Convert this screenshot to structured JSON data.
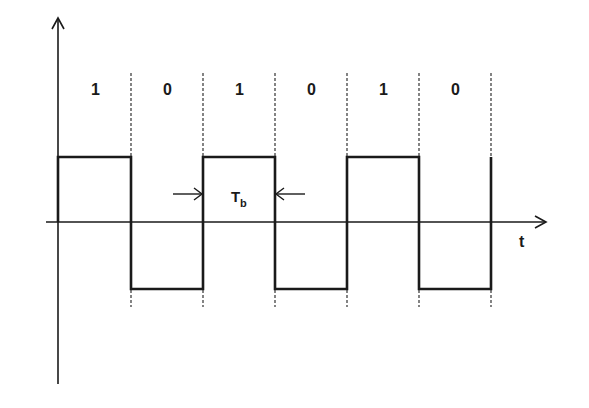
{
  "diagram": {
    "type": "polar-NRZ-square-wave",
    "bits": [
      "1",
      "0",
      "1",
      "0",
      "1",
      "0"
    ],
    "bit_period_label": "T",
    "bit_period_subscript": "b",
    "x_axis_label": "t",
    "colors": {
      "stroke": "#1a1a1a",
      "dashed": "#333333",
      "background": "#ffffff"
    },
    "geometry": {
      "y_axis_x": 58,
      "x_axis_y": 222,
      "high_y": 157,
      "low_y": 289,
      "boundaries_x": [
        58,
        131,
        203,
        275,
        347,
        419,
        491
      ]
    }
  }
}
